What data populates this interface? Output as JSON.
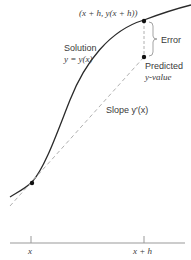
{
  "figure": {
    "point_label": "(x + h, y(x + h))",
    "error_label": "Error",
    "solution_label_1": "Solution",
    "solution_label_2": "y = y(x)",
    "predicted_label_1": "Predicted",
    "predicted_label_2": "y-value",
    "slope_label": "Slope y′(x)",
    "axis_tick_left": "x",
    "axis_tick_right": "x + h",
    "colors": {
      "curve": "#2a2a2a",
      "tangent": "#b0b0b0",
      "axis": "#999999",
      "text": "#3a3a3a"
    }
  }
}
